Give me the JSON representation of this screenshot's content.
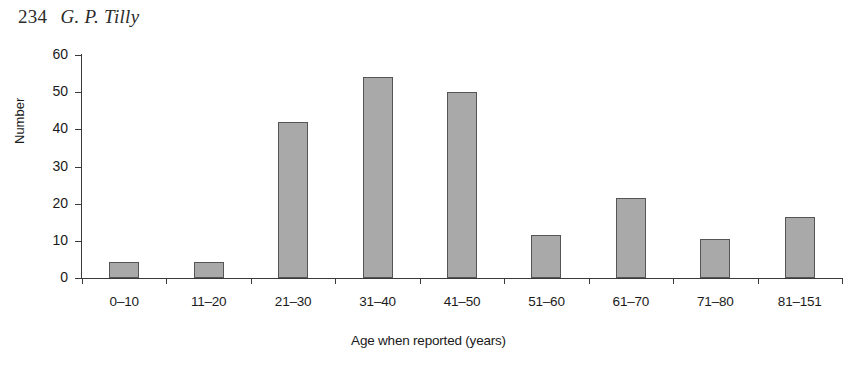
{
  "page_header": {
    "folio": "234",
    "author": "G. P. Tilly"
  },
  "chart_data": {
    "type": "bar",
    "title": "",
    "xlabel": "Age when reported (years)",
    "ylabel": "Number",
    "categories": [
      "0–10",
      "11–20",
      "21–30",
      "31–40",
      "41–50",
      "51–60",
      "61–70",
      "71–80",
      "81–151"
    ],
    "values": [
      4.3,
      4.3,
      42,
      54,
      50,
      11.5,
      21.5,
      10.5,
      16.5
    ],
    "ylim": [
      0,
      60
    ],
    "yticks": [
      0,
      10,
      20,
      30,
      40,
      50,
      60
    ],
    "ytick_labels": [
      "0",
      "10",
      "20",
      "30",
      "40",
      "50",
      "60"
    ],
    "grid": false,
    "legend": false,
    "bar_color": "#a9a9a9",
    "bar_edge_color": "#555555",
    "axis_color": "#3a3a3a"
  }
}
